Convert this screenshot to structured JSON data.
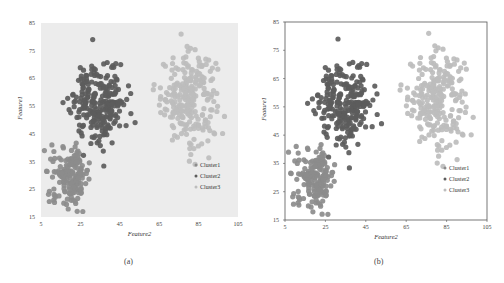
{
  "figure": {
    "captions": [
      "(a)",
      "(b)"
    ]
  },
  "colors": {
    "cluster1": "#8c8c8c",
    "cluster2": "#5c5c5c",
    "cluster3": "#bdbdbd",
    "panel_a_bg": "#ececec",
    "panel_b_bg": "#ffffff",
    "panel_b_border": "#555555"
  },
  "chart_data": [
    {
      "type": "scatter",
      "panel": "(a)",
      "title": "",
      "xlabel": "Feature2",
      "ylabel": "Feature1",
      "xlim": [
        5,
        105
      ],
      "ylim": [
        15,
        85
      ],
      "xticks": [
        5,
        25,
        45,
        65,
        85,
        105
      ],
      "yticks": [
        15,
        25,
        35,
        45,
        55,
        65,
        75,
        85
      ],
      "grid": false,
      "background": "light gray",
      "legend_position": "lower right",
      "legend": [
        "Cluster1",
        "Cluster2",
        "Cluster3"
      ],
      "series": [
        {
          "name": "Cluster1",
          "center": [
            20,
            30
          ],
          "spread": [
            5,
            5
          ],
          "count": 170,
          "x_range": [
            6,
            30
          ],
          "y_range": [
            17,
            42
          ]
        },
        {
          "name": "Cluster2",
          "center": [
            35,
            56
          ],
          "spread": [
            7,
            7
          ],
          "count": 250,
          "x_range": [
            12,
            62
          ],
          "y_range": [
            33,
            79
          ]
        },
        {
          "name": "Cluster3",
          "center": [
            80,
            58
          ],
          "spread": [
            7,
            8
          ],
          "count": 250,
          "x_range": [
            62,
            100
          ],
          "y_range": [
            34,
            81
          ]
        }
      ]
    },
    {
      "type": "scatter",
      "panel": "(b)",
      "title": "",
      "xlabel": "Feature2",
      "ylabel": "Feature1",
      "xlim": [
        5,
        105
      ],
      "ylim": [
        15,
        85
      ],
      "xticks": [
        5,
        25,
        45,
        65,
        85,
        105
      ],
      "yticks": [
        15,
        25,
        35,
        45,
        55,
        65,
        75,
        85
      ],
      "grid": false,
      "background": "white with border",
      "legend_position": "lower right",
      "legend": [
        "Cluster1",
        "Cluster2",
        "Cluster3"
      ],
      "series": [
        {
          "name": "Cluster1",
          "center": [
            20,
            30
          ],
          "spread": [
            5,
            5
          ],
          "count": 170,
          "x_range": [
            6,
            30
          ],
          "y_range": [
            17,
            42
          ]
        },
        {
          "name": "Cluster2",
          "center": [
            35,
            56
          ],
          "spread": [
            7,
            7
          ],
          "count": 250,
          "x_range": [
            12,
            62
          ],
          "y_range": [
            33,
            79
          ]
        },
        {
          "name": "Cluster3",
          "center": [
            80,
            58
          ],
          "spread": [
            7,
            8
          ],
          "count": 250,
          "x_range": [
            62,
            100
          ],
          "y_range": [
            34,
            81
          ]
        }
      ]
    }
  ]
}
